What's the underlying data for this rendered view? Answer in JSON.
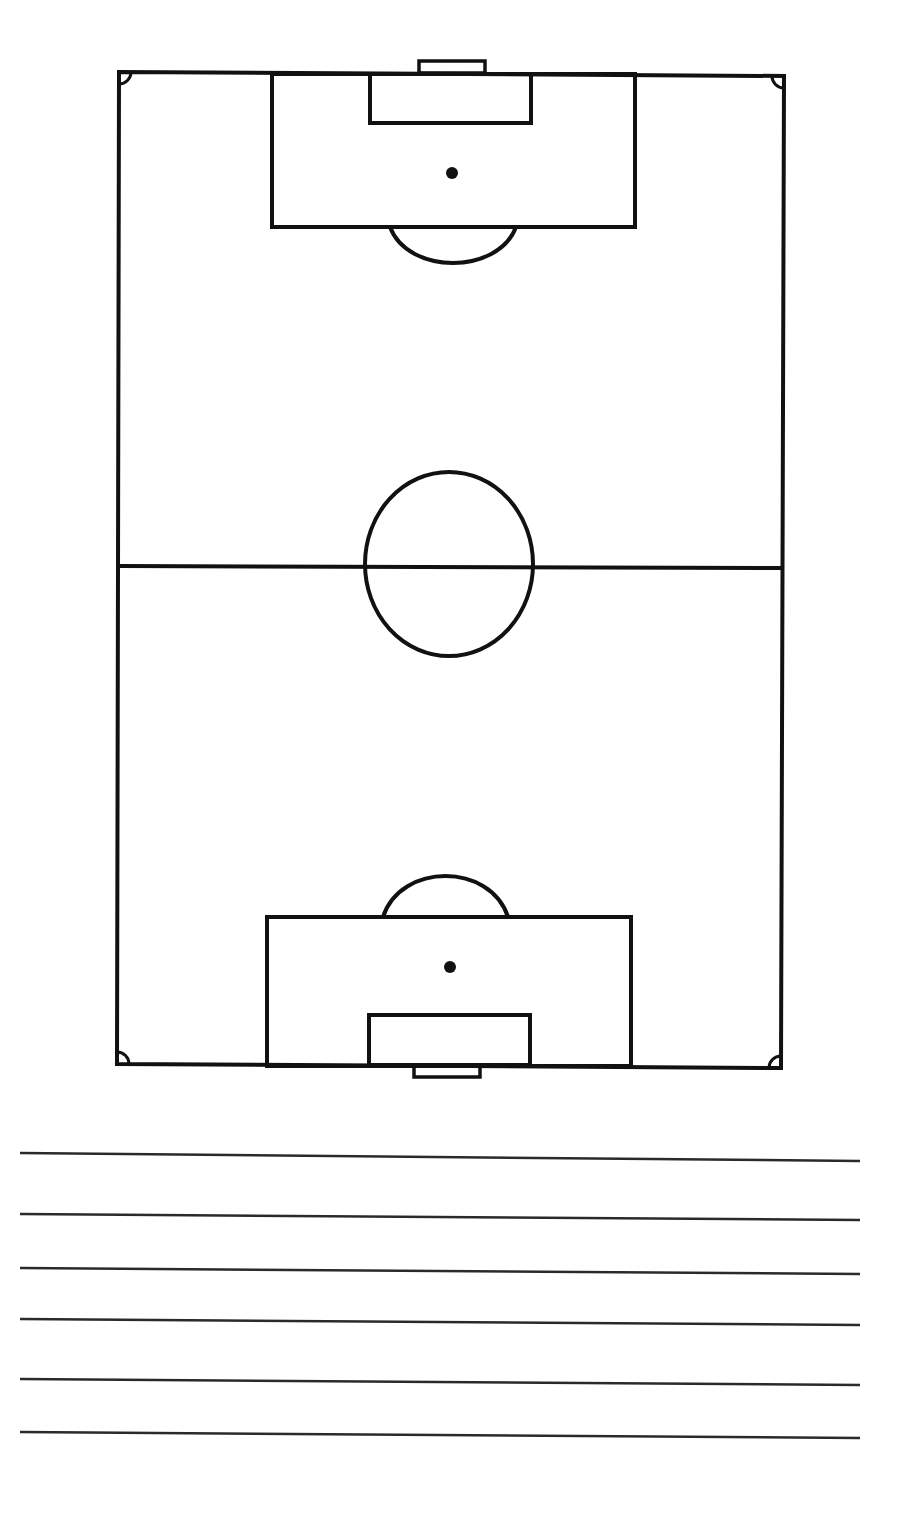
{
  "colors": {
    "background": "#ffffff",
    "line": "#111111",
    "note_line": "#2a2a2a"
  },
  "field": {
    "outline": {
      "x1": 119,
      "y1": 72,
      "x2": 784,
      "y2": 76,
      "x3": 781,
      "y3": 1068,
      "x4": 117,
      "y4": 1064
    },
    "halfway_line": {
      "x1": 119,
      "y1": 566,
      "x2": 782,
      "y2": 568
    },
    "center_circle": {
      "cx": 449,
      "cy": 564,
      "rx": 84,
      "ry": 92
    },
    "top": {
      "goal": {
        "x": 419,
        "y": 61,
        "w": 66,
        "h": 12
      },
      "penalty_box": {
        "x": 272,
        "y": 74,
        "w": 363,
        "h": 153
      },
      "goal_box": {
        "x": 370,
        "y": 74,
        "w": 161,
        "h": 49
      },
      "penalty_spot": {
        "cx": 452,
        "cy": 173,
        "r": 6
      },
      "arc": {
        "x1": 390,
        "y1": 227,
        "x2": 516,
        "y2": 227,
        "cy": 263
      }
    },
    "bottom": {
      "goal": {
        "x": 414,
        "y": 1065,
        "w": 66,
        "h": 12
      },
      "penalty_box": {
        "x": 267,
        "y": 917,
        "w": 364,
        "h": 149
      },
      "goal_box": {
        "x": 369,
        "y": 1015,
        "w": 161,
        "h": 50
      },
      "penalty_spot": {
        "cx": 450,
        "cy": 967,
        "r": 6
      },
      "arc": {
        "x1": 383,
        "y1": 917,
        "x2": 508,
        "y2": 917,
        "cy": 876
      }
    },
    "corner_arc_radius": 12
  },
  "notes": {
    "lines": [
      {
        "x1": 20,
        "y1": 1153,
        "x2": 860,
        "y2": 1161
      },
      {
        "x1": 20,
        "y1": 1214,
        "x2": 860,
        "y2": 1220
      },
      {
        "x1": 20,
        "y1": 1268,
        "x2": 860,
        "y2": 1274
      },
      {
        "x1": 20,
        "y1": 1319,
        "x2": 860,
        "y2": 1325
      },
      {
        "x1": 20,
        "y1": 1379,
        "x2": 860,
        "y2": 1385
      },
      {
        "x1": 20,
        "y1": 1432,
        "x2": 860,
        "y2": 1438
      }
    ]
  }
}
